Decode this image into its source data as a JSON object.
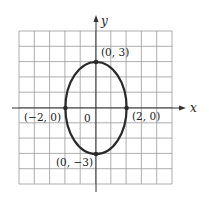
{
  "diagram": {
    "type": "ellipse-graph",
    "equation_hint": "x^2/4 + y^2/9 = 1",
    "axes": {
      "x_label": "x",
      "y_label": "y",
      "origin_label": "0"
    },
    "grid": {
      "x_range": [
        -5,
        5
      ],
      "y_range": [
        -5,
        5
      ],
      "step": 1
    },
    "points": [
      {
        "x": 0,
        "y": 3,
        "label": "(0, 3)"
      },
      {
        "x": -2,
        "y": 0,
        "label": "(−2, 0)"
      },
      {
        "x": 2,
        "y": 0,
        "label": "(2, 0)"
      },
      {
        "x": 0,
        "y": -3,
        "label": "(0, −3)"
      }
    ],
    "colors": {
      "grid": "#9a9a9a",
      "curve": "#2a2a2a",
      "axis": "#333333"
    }
  }
}
